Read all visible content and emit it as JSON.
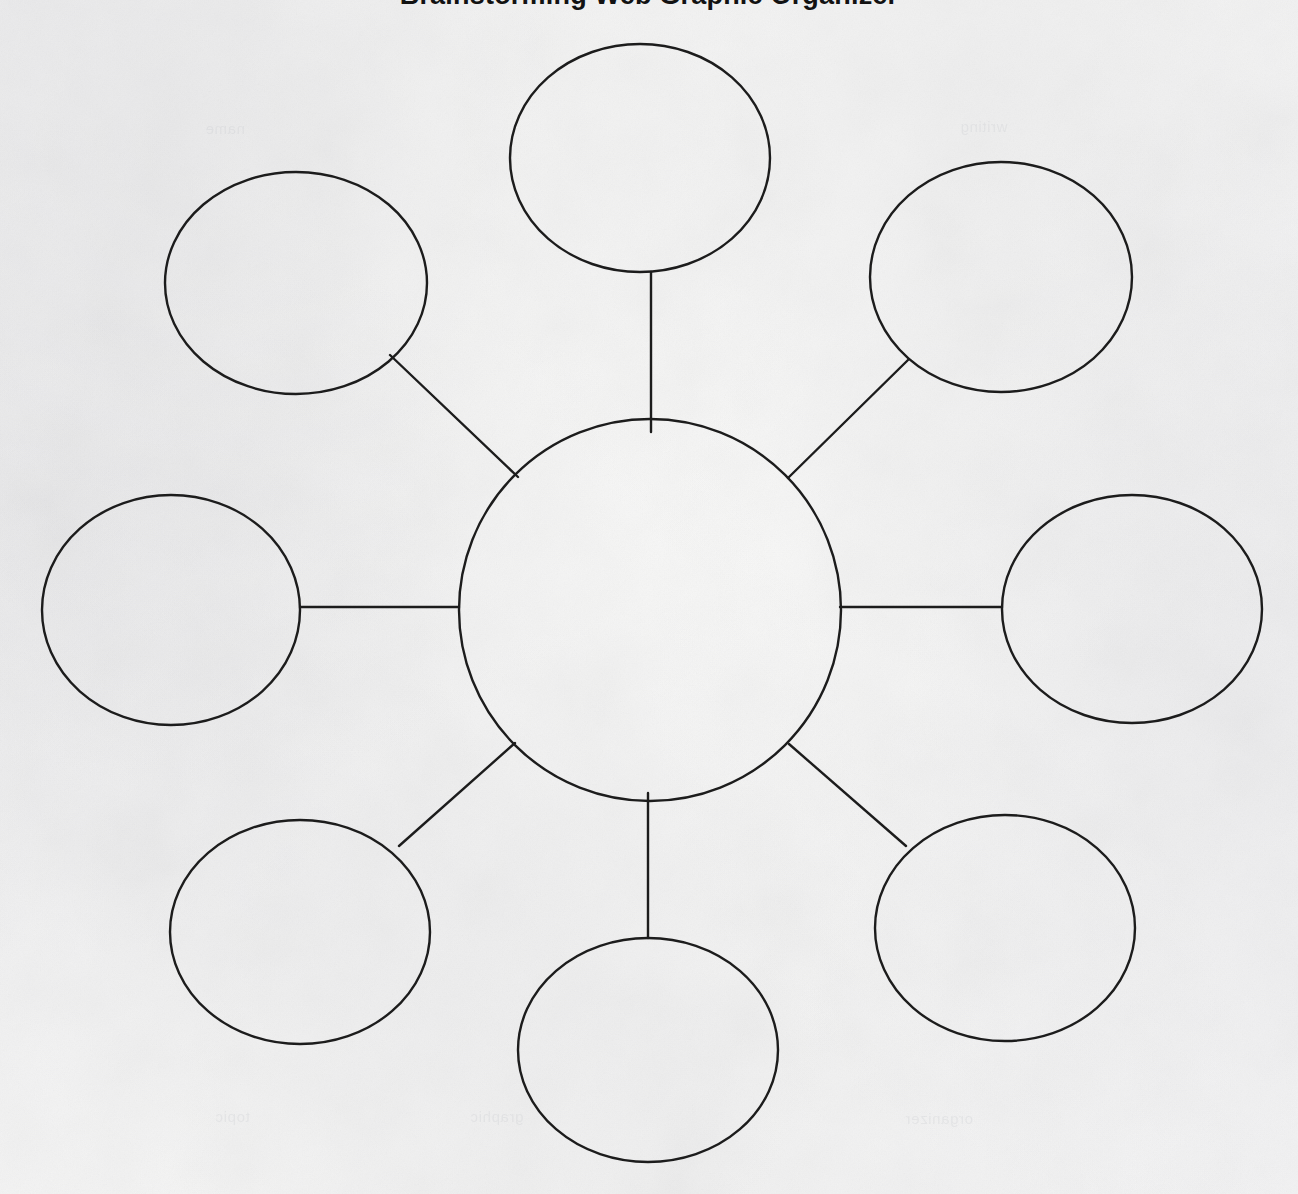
{
  "document": {
    "title": "Brainstorming Web Graphic Organizer",
    "type": "spider-web-graphic-organizer",
    "paper_color": "#fafaf9",
    "ink_color": "#1c1c1c",
    "title_clipped": true
  },
  "ghost_text": [
    {
      "id": "g1",
      "text": "writing",
      "x": 960,
      "y": 118
    },
    {
      "id": "g2",
      "text": "name",
      "x": 205,
      "y": 120
    },
    {
      "id": "g3",
      "text": "graphic",
      "x": 470,
      "y": 1108
    },
    {
      "id": "g4",
      "text": "organizer",
      "x": 905,
      "y": 1110
    },
    {
      "id": "g5",
      "text": "topic",
      "x": 215,
      "y": 1108
    }
  ],
  "chart_data": {
    "type": "diagram",
    "title": "Brainstorming Web Graphic Organizer",
    "layout": "radial",
    "node_count": 9,
    "center_node": {
      "id": "center",
      "label": "",
      "role": "main-topic",
      "cx": 650,
      "cy": 610,
      "rx": 191,
      "ry": 191
    },
    "outer_nodes": [
      {
        "id": "node-top",
        "label": "",
        "role": "detail",
        "position": "top",
        "cx": 640,
        "cy": 158,
        "rx": 130,
        "ry": 114
      },
      {
        "id": "node-top-right",
        "label": "",
        "role": "detail",
        "position": "top-right",
        "cx": 1001,
        "cy": 277,
        "rx": 131,
        "ry": 115
      },
      {
        "id": "node-right",
        "label": "",
        "role": "detail",
        "position": "right",
        "cx": 1132,
        "cy": 609,
        "rx": 130,
        "ry": 114
      },
      {
        "id": "node-bottom-right",
        "label": "",
        "role": "detail",
        "position": "bottom-right",
        "cx": 1005,
        "cy": 928,
        "rx": 130,
        "ry": 113
      },
      {
        "id": "node-bottom",
        "label": "",
        "role": "detail",
        "position": "bottom",
        "cx": 648,
        "cy": 1050,
        "rx": 130,
        "ry": 112
      },
      {
        "id": "node-bottom-left",
        "label": "",
        "role": "detail",
        "position": "bottom-left",
        "cx": 300,
        "cy": 932,
        "rx": 130,
        "ry": 112
      },
      {
        "id": "node-left",
        "label": "",
        "role": "detail",
        "position": "left",
        "cx": 171,
        "cy": 610,
        "rx": 129,
        "ry": 115
      },
      {
        "id": "node-top-left",
        "label": "",
        "role": "detail",
        "position": "top-left",
        "cx": 296,
        "cy": 283,
        "rx": 131,
        "ry": 111
      }
    ],
    "connectors": [
      {
        "id": "edge-top",
        "from": "center",
        "to": "node-top",
        "x1": 651,
        "y1": 432,
        "x2": 651,
        "y2": 272
      },
      {
        "id": "edge-top-right",
        "from": "center",
        "to": "node-top-right",
        "x1": 788,
        "y1": 478,
        "x2": 908,
        "y2": 360
      },
      {
        "id": "edge-right",
        "from": "center",
        "to": "node-right",
        "x1": 840,
        "y1": 607,
        "x2": 1002,
        "y2": 607
      },
      {
        "id": "edge-bottom-right",
        "from": "center",
        "to": "node-bottom-right",
        "x1": 789,
        "y1": 744,
        "x2": 906,
        "y2": 846
      },
      {
        "id": "edge-bottom",
        "from": "center",
        "to": "node-bottom",
        "x1": 648,
        "y1": 793,
        "x2": 648,
        "y2": 938
      },
      {
        "id": "edge-bottom-left",
        "from": "center",
        "to": "node-bottom-left",
        "x1": 515,
        "y1": 743,
        "x2": 399,
        "y2": 846
      },
      {
        "id": "edge-left",
        "from": "center",
        "to": "node-left",
        "x1": 459,
        "y1": 607,
        "x2": 300,
        "y2": 607
      },
      {
        "id": "edge-top-right-2",
        "from": "center",
        "to": "node-top-left",
        "x1": 518,
        "y1": 477,
        "x2": 390,
        "y2": 355
      }
    ],
    "stroke_width": 2.4,
    "stroke_color": "#1c1c1c",
    "fill": "none"
  }
}
